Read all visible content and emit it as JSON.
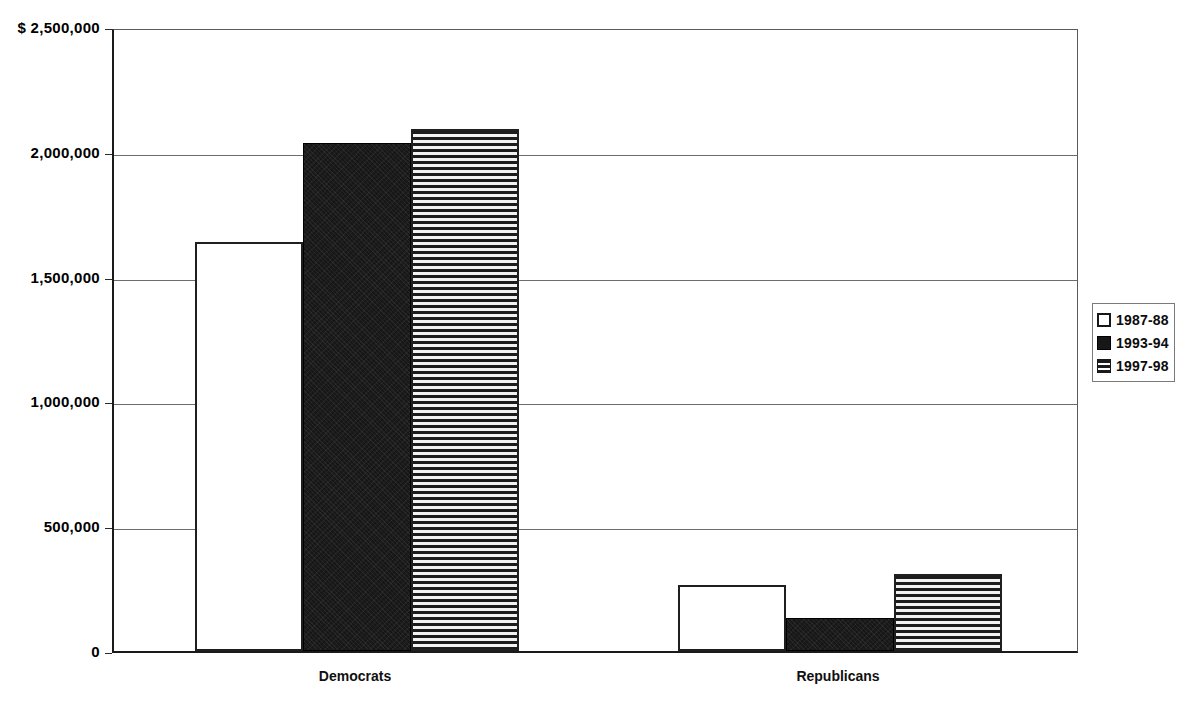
{
  "chart_data": {
    "type": "bar",
    "title": "",
    "subtitle": "",
    "xlabel": "",
    "ylabel": "",
    "categories": [
      "Democrats",
      "Republicans"
    ],
    "series": [
      {
        "name": "1987-88",
        "fill": "open",
        "values": [
          1640000,
          265000
        ]
      },
      {
        "name": "1993-94",
        "fill": "solid",
        "values": [
          2035000,
          132000
        ]
      },
      {
        "name": "1997-98",
        "fill": "hstripe",
        "values": [
          2090000,
          310000
        ]
      }
    ],
    "ylim": [
      0,
      2500000
    ],
    "ytick_values": [
      0,
      500000,
      1000000,
      1500000,
      2000000,
      2500000
    ],
    "ytick_labels": [
      "0",
      "500,000",
      "1,000,000",
      "1,500,000",
      "2,000,000",
      "$ 2,500,000"
    ],
    "grid": true,
    "grid_axis": "y",
    "legend_position": "right",
    "colors": {
      "axis": "#1a1a1a",
      "grid": "#6d6d6d",
      "bar_outline": "#1f1f1f",
      "bar_solid": "#171717",
      "background": "#ffffff"
    }
  },
  "legend": {
    "items": [
      {
        "label": "1987-88",
        "fill": "open"
      },
      {
        "label": "1993-94",
        "fill": "solid"
      },
      {
        "label": "1997-98",
        "fill": "hstripe"
      }
    ]
  }
}
